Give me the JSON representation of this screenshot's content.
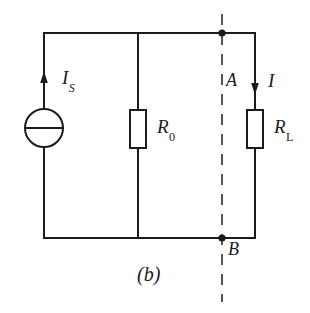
{
  "figure": {
    "caption": "(b)",
    "background_color": "#ffffff",
    "line_color": "#1b1b1b"
  },
  "labels": {
    "source_current": {
      "symbol": "I",
      "subscript": "S"
    },
    "internal_resistor": {
      "symbol": "R",
      "subscript": "0"
    },
    "load_resistor": {
      "symbol": "R",
      "subscript": "L"
    },
    "branch_current": {
      "symbol": "I",
      "subscript": ""
    },
    "terminal_top": {
      "symbol": "A",
      "subscript": ""
    },
    "terminal_bottom": {
      "symbol": "B",
      "subscript": ""
    }
  },
  "components": {
    "current_source": {
      "name": "ideal-current-source",
      "shape": "circle-with-horizontal-bar",
      "arrow_direction": "up"
    },
    "resistor_r0": {
      "name": "resistor",
      "shape": "rectangle"
    },
    "resistor_rl": {
      "name": "resistor",
      "shape": "rectangle",
      "arrow_direction": "down"
    },
    "cut_line": {
      "name": "terminal-cut-line",
      "style": "dashed",
      "orientation": "vertical"
    },
    "node_a": {
      "name": "junction-dot"
    },
    "node_b": {
      "name": "junction-dot"
    }
  }
}
